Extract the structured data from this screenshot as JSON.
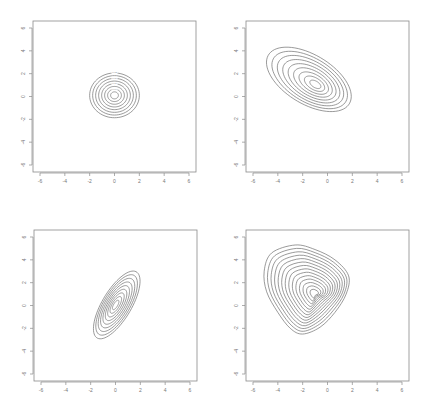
{
  "figure": {
    "layout": "2x2 grid of contour plots",
    "panels": [
      {
        "id": "p1",
        "position": "top-left"
      },
      {
        "id": "p2",
        "position": "top-right"
      },
      {
        "id": "p3",
        "position": "bottom-left"
      },
      {
        "id": "p4",
        "position": "bottom-right"
      }
    ]
  },
  "chart_data": [
    {
      "type": "contour",
      "title": "",
      "xlabel": "",
      "ylabel": "",
      "xlim": [
        -6,
        6
      ],
      "ylim": [
        -6,
        6
      ],
      "x_ticks": [
        "-6",
        "-4",
        "-2",
        "0",
        "2",
        "4",
        "6"
      ],
      "y_ticks": [
        "-6",
        "-4",
        "-2",
        "0",
        "2",
        "4",
        "6"
      ],
      "grid": false,
      "description": "Isotropic bivariate density, circular contours",
      "center": [
        0,
        0.1
      ],
      "cov": [
        [
          1,
          0
        ],
        [
          0,
          1
        ]
      ],
      "n_levels": 8,
      "outer_radius": 2.0
    },
    {
      "type": "contour",
      "title": "",
      "xlabel": "",
      "ylabel": "",
      "xlim": [
        -6,
        6
      ],
      "ylim": [
        -6,
        6
      ],
      "x_ticks": [
        "-6",
        "-4",
        "-2",
        "0",
        "2",
        "4",
        "6"
      ],
      "y_ticks": [
        "-6",
        "-4",
        "-2",
        "0",
        "2",
        "4",
        "6"
      ],
      "grid": false,
      "description": "Negatively correlated elliptical density",
      "center": [
        -1,
        1
      ],
      "rotation_deg": -35,
      "semi_axes_outer": [
        3.9,
        2.1
      ],
      "n_levels": 9
    },
    {
      "type": "contour",
      "title": "",
      "xlabel": "",
      "ylabel": "",
      "xlim": [
        -6,
        6
      ],
      "ylim": [
        -6,
        6
      ],
      "x_ticks": [
        "-6",
        "-4",
        "-2",
        "0",
        "2",
        "4",
        "6"
      ],
      "y_ticks": [
        "-6",
        "-4",
        "-2",
        "0",
        "2",
        "4",
        "6"
      ],
      "grid": false,
      "description": "Positively correlated elliptical density",
      "center": [
        0,
        0
      ],
      "rotation_deg": 62,
      "semi_axes_outer": [
        3.3,
        1.2
      ],
      "n_levels": 9
    },
    {
      "type": "contour",
      "title": "",
      "xlabel": "",
      "ylabel": "",
      "xlim": [
        -6,
        6
      ],
      "ylim": [
        -6,
        6
      ],
      "x_ticks": [
        "-6",
        "-4",
        "-2",
        "0",
        "2",
        "4",
        "6"
      ],
      "y_ticks": [
        "-6",
        "-4",
        "-2",
        "0",
        "2",
        "4",
        "6"
      ],
      "grid": false,
      "description": "Skewed (triangular-shaped) density, peak near (-1, 1), contours compressed toward lower-right",
      "peak": [
        -1,
        1
      ],
      "n_levels": 14,
      "outer_extent": {
        "xmin": -5.2,
        "xmax": 1.8,
        "ymin": -2.5,
        "ymax": 5.3
      }
    }
  ]
}
